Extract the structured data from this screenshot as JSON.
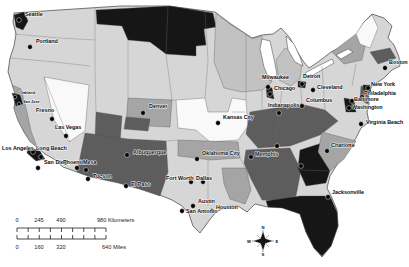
{
  "canvas": {
    "width": 409,
    "height": 267,
    "background": "#ffffff"
  },
  "palette": {
    "white": "#f9f9f9",
    "light": "#d6d6d6",
    "medium_light": "#c2c2c2",
    "medium": "#a5a5a5",
    "dark": "#5d5d5d",
    "black": "#161616",
    "outline_stroke": "#3f3f3f",
    "border_stroke": "#6f6f6f",
    "lake_fill": "#ffffff",
    "dot_color": "#000000",
    "label_color": "#0a0a0a"
  },
  "outline": {
    "name": "us-outline",
    "fill": "light",
    "d": "M 14,13 L 120,6 L 168,6 L 215,12 L 231,24 L 243,32 L 252,38 L 262,35 L 273,34 L 281,28 L 290,38 L 297,51 L 303,61 L 309,68 L 318,62 L 331,52 L 343,46 L 352,42 L 358,32 L 364,22 L 372,14 L 384,18 L 392,26 L 388,38 L 394,45 L 399,57 L 400,66 L 392,70 L 384,78 L 372,86 L 368,94 L 369,104 L 367,112 L 369,122 L 361,128 L 356,138 L 348,150 L 338,163 L 330,176 L 327,188 L 332,198 L 337,210 L 338,226 L 331,246 L 322,257 L 314,248 L 306,232 L 300,214 L 287,207 L 268,207 L 255,204 L 247,212 L 238,206 L 228,206 L 216,212 L 208,222 L 200,233 L 193,226 L 189,214 L 182,206 L 172,200 L 162,196 L 150,191 L 139,188 L 130,186 L 118,182 L 104,179 L 90,176 L 77,172 L 63,167 L 54,159 L 45,154 L 37,147 L 30,141 L 24,132 L 18,120 L 14,108 L 16,96 L 12,84 L 8,72 L 10,58 L 14,46 L 16,34 L 13,22 Z"
  },
  "regions": [
    {
      "name": "region-northern-plains",
      "shade": "black",
      "points": "96,10 170,6 213,13 216,27 204,29 206,45 196,46 196,56 166,54 150,42 128,40 122,26 97,24"
    },
    {
      "name": "region-upper-midwest",
      "shade": "medium_light",
      "points": "216,13 231,25 244,33 252,39 262,36 263,50 268,70 272,82 262,90 242,92 224,88 214,62"
    },
    {
      "name": "region-michigan",
      "shade": "medium_light",
      "points": "276,60 285,48 296,54 302,64 300,78 291,86 279,80"
    },
    {
      "name": "region-nevada",
      "shade": "white",
      "points": "44,77 89,85 85,131 69,142 54,120"
    },
    {
      "name": "region-california-coast",
      "shade": "medium",
      "points": "12,85 21,89 27,112 31,131 37,147 30,142 18,121 14,109 16,97"
    },
    {
      "name": "region-south-utah",
      "shade": "dark",
      "points": "96,112 122,116 120,143 95,139"
    },
    {
      "name": "region-colorado",
      "shade": "medium",
      "points": "128,98 172,100 170,127 126,125"
    },
    {
      "name": "region-south-colorado",
      "shade": "dark",
      "points": "126,117 150,119 148,131 124,129"
    },
    {
      "name": "region-southwest",
      "shade": "dark",
      "points": "85,133 128,139 166,141 168,172 160,196 139,189 118,183 90,177 77,172"
    },
    {
      "name": "region-central-plains",
      "shade": "white",
      "points": "176,100 205,98 208,112 228,112 232,98 246,100 248,126 238,140 210,142 196,130 178,128"
    },
    {
      "name": "region-oklahoma",
      "shade": "medium",
      "points": "178,140 238,142 240,158 210,160 196,158 178,156"
    },
    {
      "name": "region-appalachia",
      "shade": "dark",
      "points": "250,112 300,104 325,110 338,121 320,135 290,146 258,148 246,134"
    },
    {
      "name": "region-deep-south",
      "shade": "dark",
      "points": "246,150 290,148 301,170 296,196 280,201 262,200 252,181 244,163"
    },
    {
      "name": "region-georgia",
      "shade": "black",
      "points": "300,150 322,143 333,161 326,183 306,186 298,168"
    },
    {
      "name": "region-carolinas",
      "shade": "medium",
      "points": "322,132 356,141 344,159 330,171 318,152"
    },
    {
      "name": "region-louisiana",
      "shade": "medium",
      "points": "222,168 246,168 251,190 245,204 230,199 224,184"
    },
    {
      "name": "region-florida",
      "shade": "black",
      "points": "266,201 300,196 330,196 337,212 338,226 331,246 322,256 314,248 306,232 300,214 282,208 268,207"
    },
    {
      "name": "region-new-york",
      "shade": "medium",
      "points": "332,52 356,34 366,42 362,60 344,64"
    },
    {
      "name": "region-new-england-north",
      "shade": "white",
      "points": "356,34 364,22 372,15 378,28 370,48 360,44"
    },
    {
      "name": "region-new-england-south",
      "shade": "dark",
      "points": "370,52 390,48 396,58 378,64"
    },
    {
      "name": "region-nj-md",
      "shade": "dark",
      "points": "361,86 370,88 368,104 360,100"
    },
    {
      "name": "region-seattle-metro",
      "shade": "black",
      "points": "14,15 24,12 28,21 23,30 16,27"
    },
    {
      "name": "region-bay-area-metro",
      "shade": "black",
      "points": "12,93 20,95 23,104 16,106"
    },
    {
      "name": "region-la-metro",
      "shade": "black",
      "points": "28,147 40,151 45,159 36,161 27,153"
    },
    {
      "name": "region-chicago-metro",
      "shade": "black",
      "points": "266,86 272,88 274,99 267,97"
    },
    {
      "name": "region-detroit-metro",
      "shade": "black",
      "points": "298,81 306,82 305,88 298,87"
    },
    {
      "name": "region-nyc-metro",
      "shade": "black",
      "points": "363,85 370,85 371,92 364,93"
    },
    {
      "name": "region-dc-baltimore-metro",
      "shade": "black",
      "points": "344,98 354,100 356,112 346,112"
    }
  ],
  "lakes": [
    {
      "name": "lake-michigan",
      "points": "262,39 270,41 274,59 277,75 270,81 264,67 260,49"
    },
    {
      "name": "lake-huron",
      "points": "286,36 294,44 300,57 303,66 295,62 288,50"
    },
    {
      "name": "lake-erie",
      "points": "305,73 318,66 332,59 334,63 320,71 308,78"
    },
    {
      "name": "lake-ontario",
      "points": "336,55 348,49 353,52 341,59"
    }
  ],
  "state_borders": [
    "M 14,34 L 60,38 L 95,40",
    "M 10,58 L 55,62 L 90,66",
    "M 44,77 L 70,142",
    "M 95,8 L 95,70 L 96,112",
    "M 128,40 L 128,98",
    "M 168,6 L 166,54 L 172,100",
    "M 205,12 L 208,60 L 205,98",
    "M 246,34 L 246,100",
    "M 170,100 L 176,100",
    "M 166,141 L 178,140",
    "M 240,158 L 252,181",
    "M 262,90 L 262,112",
    "M 282,90 L 279,113 L 276,140",
    "M 300,78 L 302,104",
    "M 322,66 L 325,110",
    "M 232,112 L 246,112",
    "M 208,160 L 208,206",
    "M 356,64 L 352,86",
    "M 330,171 L 300,170"
  ],
  "cities": [
    {
      "name": "seattle",
      "label": "Seattle",
      "dot": [
        19,
        20
      ],
      "lpos": [
        25,
        16
      ],
      "anchor": "start"
    },
    {
      "name": "portland",
      "label": "Portland",
      "dot": [
        30,
        47
      ],
      "lpos": [
        36,
        43
      ],
      "anchor": "start"
    },
    {
      "name": "oakland",
      "label": "Oakland",
      "dot": [
        15,
        97
      ],
      "lpos": [
        20,
        94
      ],
      "anchor": "start",
      "size": 3.8,
      "r": 1.8
    },
    {
      "name": "san-jose",
      "label": "San Jose",
      "dot": [
        19,
        104
      ],
      "lpos": [
        23,
        103
      ],
      "anchor": "start",
      "size": 3.8,
      "r": 1.8
    },
    {
      "name": "fresno",
      "label": "Fresno",
      "dot": [
        52,
        119
      ],
      "lpos": [
        36,
        112
      ],
      "anchor": "start"
    },
    {
      "name": "las-vegas",
      "label": "Las Vegas",
      "dot": [
        66,
        136
      ],
      "lpos": [
        55,
        129
      ],
      "anchor": "start"
    },
    {
      "name": "los-angeles",
      "label": "Los Angeles",
      "dot": [
        33,
        152
      ],
      "lpos": [
        2,
        150
      ],
      "anchor": "start"
    },
    {
      "name": "long-beach",
      "label": "Long Beach",
      "dot": [
        41,
        157
      ],
      "lpos": [
        36,
        150
      ],
      "anchor": "start"
    },
    {
      "name": "san-diego",
      "label": "San Diego",
      "dot": [
        38,
        168
      ],
      "lpos": [
        44,
        164
      ],
      "anchor": "start"
    },
    {
      "name": "phoenix",
      "label": "Phoenix",
      "dot": [
        77,
        168
      ],
      "lpos": [
        63,
        164
      ],
      "anchor": "start"
    },
    {
      "name": "mesa",
      "label": "Mesa",
      "dot": [
        86,
        170
      ],
      "lpos": [
        83,
        164
      ],
      "anchor": "start"
    },
    {
      "name": "tucson",
      "label": "Tucson",
      "dot": [
        88,
        179
      ],
      "lpos": [
        93,
        178
      ],
      "anchor": "start"
    },
    {
      "name": "el-paso",
      "label": "El Paso",
      "dot": [
        126,
        186
      ],
      "lpos": [
        131,
        186
      ],
      "anchor": "start"
    },
    {
      "name": "denver",
      "label": "Denver",
      "dot": [
        143,
        113
      ],
      "lpos": [
        149,
        108
      ],
      "anchor": "start"
    },
    {
      "name": "albuquerque",
      "label": "Albuquerque",
      "dot": [
        127,
        155
      ],
      "lpos": [
        133,
        154
      ],
      "anchor": "start"
    },
    {
      "name": "oklahoma-city",
      "label": "Oklahoma City",
      "dot": [
        197,
        159
      ],
      "lpos": [
        202,
        155
      ],
      "anchor": "start"
    },
    {
      "name": "kansas-city",
      "label": "Kansas City",
      "dot": [
        218,
        123
      ],
      "lpos": [
        223,
        119
      ],
      "anchor": "start"
    },
    {
      "name": "fort-worth",
      "label": "Fort Worth",
      "dot": [
        191,
        182
      ],
      "lpos": [
        166,
        180
      ],
      "anchor": "start"
    },
    {
      "name": "dallas",
      "label": "Dallas",
      "dot": [
        203,
        182
      ],
      "lpos": [
        196,
        180
      ],
      "anchor": "start"
    },
    {
      "name": "austin",
      "label": "Austin",
      "dot": [
        193,
        206
      ],
      "lpos": [
        198,
        203
      ],
      "anchor": "start"
    },
    {
      "name": "san-antonio",
      "label": "San Antonio",
      "dot": [
        182,
        211
      ],
      "lpos": [
        186,
        213
      ],
      "anchor": "start"
    },
    {
      "name": "houston",
      "label": "Houston",
      "dot": [
        212,
        211
      ],
      "lpos": [
        216,
        209
      ],
      "anchor": "start"
    },
    {
      "name": "milwaukee",
      "label": "Milwaukee",
      "dot": [
        268,
        87
      ],
      "lpos": [
        262,
        79
      ],
      "anchor": "start"
    },
    {
      "name": "chicago",
      "label": "Chicago",
      "dot": [
        270,
        94
      ],
      "lpos": [
        274,
        90
      ],
      "anchor": "start"
    },
    {
      "name": "detroit",
      "label": "Detroit",
      "dot": [
        302,
        84
      ],
      "lpos": [
        303,
        78
      ],
      "anchor": "start"
    },
    {
      "name": "cleveland",
      "label": "Cleveland",
      "dot": [
        313,
        90
      ],
      "lpos": [
        317,
        89
      ],
      "anchor": "start"
    },
    {
      "name": "indianapolis",
      "label": "Indianapolis",
      "dot": [
        279,
        113
      ],
      "lpos": [
        268,
        107
      ],
      "anchor": "start"
    },
    {
      "name": "columbus",
      "label": "Columbus",
      "dot": [
        302,
        106
      ],
      "lpos": [
        306,
        102
      ],
      "anchor": "start"
    },
    {
      "name": "boston",
      "label": "Boston",
      "dot": [
        385,
        68
      ],
      "lpos": [
        389,
        64
      ],
      "anchor": "start"
    },
    {
      "name": "new-york",
      "label": "New York",
      "dot": [
        368,
        88
      ],
      "lpos": [
        371,
        86
      ],
      "anchor": "start"
    },
    {
      "name": "philadelphia",
      "label": "Philadelphia",
      "dot": [
        362,
        97
      ],
      "lpos": [
        364,
        95
      ],
      "anchor": "start"
    },
    {
      "name": "baltimore",
      "label": "Baltimore",
      "dot": [
        352,
        101
      ],
      "lpos": [
        354,
        101
      ],
      "anchor": "start"
    },
    {
      "name": "washington",
      "label": "Washington",
      "dot": [
        349,
        108
      ],
      "lpos": [
        352,
        109
      ],
      "anchor": "start"
    },
    {
      "name": "virginia-beach",
      "label": "Virginia Beach",
      "dot": [
        361,
        124
      ],
      "lpos": [
        366,
        124
      ],
      "anchor": "start"
    },
    {
      "name": "charlotte",
      "label": "Charlotte",
      "dot": [
        327,
        151
      ],
      "lpos": [
        331,
        147
      ],
      "anchor": "start"
    },
    {
      "name": "memphis",
      "label": "Memphis",
      "dot": [
        251,
        157
      ],
      "lpos": [
        255,
        156
      ],
      "anchor": "start"
    },
    {
      "name": "jacksonville",
      "label": "Jacksonville",
      "dot": [
        328,
        197
      ],
      "lpos": [
        332,
        194
      ],
      "anchor": "start"
    }
  ],
  "unlabeled_dots": [
    [
      277,
      146
    ],
    [
      301,
      166
    ]
  ],
  "scale_bar": {
    "km": {
      "baseline_y": 228,
      "x0": 17,
      "x1": 106,
      "tick_count": 8,
      "tick_len": 4,
      "tick_dir": 1,
      "label_y": 222,
      "labels": [
        {
          "text": "0",
          "x": 17,
          "anchor": "middle"
        },
        {
          "text": "245",
          "x": 39,
          "anchor": "middle"
        },
        {
          "text": "490",
          "x": 61,
          "anchor": "middle"
        },
        {
          "text": "980 Kilometers",
          "x": 97,
          "anchor": "start"
        }
      ]
    },
    "miles": {
      "baseline_y": 239,
      "x0": 17,
      "x1": 106,
      "tick_count": 8,
      "tick_len": 4,
      "tick_dir": -1,
      "label_y": 249,
      "labels": [
        {
          "text": "0",
          "x": 17,
          "anchor": "middle"
        },
        {
          "text": "160",
          "x": 39,
          "anchor": "middle"
        },
        {
          "text": "320",
          "x": 61,
          "anchor": "middle"
        },
        {
          "text": "640 Miles",
          "x": 102,
          "anchor": "start"
        }
      ]
    }
  },
  "compass": {
    "cx": 263,
    "cy": 241,
    "star_points": "263,231 265.5,238.5 273,241 265.5,243.5 263,251 260.5,243.5 253,241 260.5,238.5",
    "cross_arm": 11,
    "diag_arm": 6,
    "letters": [
      {
        "t": "N",
        "x": 263,
        "y": 229
      },
      {
        "t": "E",
        "x": 277,
        "y": 243
      },
      {
        "t": "S",
        "x": 263,
        "y": 256
      },
      {
        "t": "W",
        "x": 249,
        "y": 243
      }
    ]
  }
}
